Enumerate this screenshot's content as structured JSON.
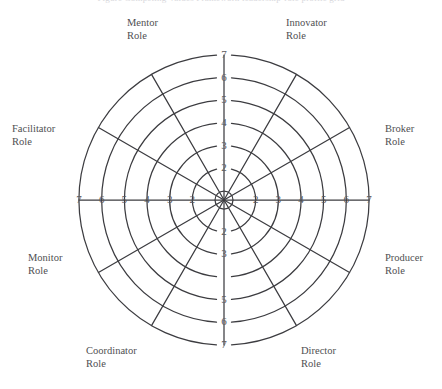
{
  "figure": {
    "caption": "Figure   Competing Values Framework leadership-role profile grid"
  },
  "chart_data": {
    "type": "radar",
    "title": "",
    "subtitle": "",
    "xlabel": "",
    "ylabel": "",
    "grid": true,
    "legend": false,
    "legend_position": "none",
    "scale_min": 1,
    "scale_max": 7,
    "ring_values": [
      2,
      3,
      4,
      5,
      6,
      7
    ],
    "center_value": 1,
    "num_axes": 8,
    "series": [],
    "axes": [
      {
        "label_line1": "Mentor",
        "label_line2": "Role",
        "angle_deg": 120,
        "position": "upper-left-of-top",
        "tick_labels": []
      },
      {
        "label_line1": "Innovator",
        "label_line2": "Role",
        "angle_deg": 60,
        "position": "upper-right-of-top",
        "tick_labels": []
      },
      {
        "label_line1": "Broker",
        "label_line2": "Role",
        "angle_deg": 0,
        "position": "right",
        "tick_labels": [
          "2",
          "3",
          "4",
          "5",
          "6",
          "7"
        ]
      },
      {
        "label_line1": "Producer",
        "label_line2": "Role",
        "angle_deg": 330,
        "position": "lower-right",
        "tick_labels": []
      },
      {
        "label_line1": "Director",
        "label_line2": "Role",
        "angle_deg": 300,
        "position": "lower-right-of-bot",
        "tick_labels": []
      },
      {
        "label_line1": "Coordinator",
        "label_line2": "Role",
        "angle_deg": 240,
        "position": "lower-left-of-bot",
        "tick_labels": []
      },
      {
        "label_line1": "Monitor",
        "label_line2": "Role",
        "angle_deg": 210,
        "position": "lower-left",
        "tick_labels": []
      },
      {
        "label_line1": "Facilitator",
        "label_line2": "Role",
        "angle_deg": 150,
        "position": "upper-left",
        "tick_labels": []
      }
    ],
    "tick_scales": {
      "top_vertical": [
        "7",
        "6",
        "5",
        "4",
        "3",
        "2"
      ],
      "bottom_vertical": [
        "7",
        "6",
        "5",
        "",
        "3",
        "2"
      ],
      "left_horizontal": [
        "7",
        "6",
        "5",
        "4",
        "3",
        "2"
      ],
      "right_horizontal": [
        "2",
        "3",
        "4",
        "5",
        "6",
        "7"
      ]
    }
  },
  "colors": {
    "background": "#ffffff",
    "stroke": "#3c3c40",
    "text": "#4f4f52",
    "tick_text": "#5a5a5d",
    "caption_text": "#d8d8dc"
  },
  "geometry": {
    "center_x": 224,
    "center_y": 200,
    "outer_radius": 145,
    "hub_radius": 9
  }
}
